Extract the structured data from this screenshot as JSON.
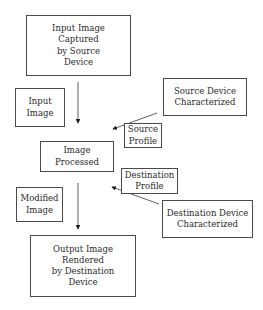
{
  "diagram": {
    "nodes": {
      "input_captured": "Input Image\nCaptured\nby Source\nDevice",
      "input_image_label": "Input\nImage",
      "source_device": "Source Device\nCharacterized",
      "source_profile": "Source\nProfile",
      "image_processed": "Image\nProcessed",
      "destination_profile": "Destination\nProfile",
      "modified_image_label": "Modified\nImage",
      "destination_device": "Destination Device\nCharacterized",
      "output_rendered": "Output Image\nRendered\nby Destination\nDevice"
    },
    "edges": [
      {
        "from": "input_captured",
        "to": "image_processed",
        "label": "Input Image"
      },
      {
        "from": "source_device",
        "to": "image_processed",
        "label": "Source Profile"
      },
      {
        "from": "destination_device",
        "to": "image_processed",
        "label": "Destination Profile"
      },
      {
        "from": "image_processed",
        "to": "output_rendered",
        "label": "Modified Image"
      }
    ]
  }
}
